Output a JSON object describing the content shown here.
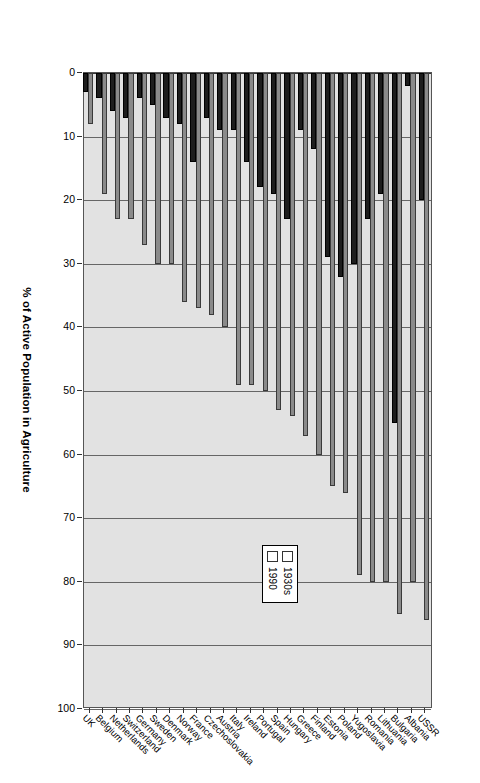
{
  "chart_data": {
    "type": "bar",
    "orientation": "vertical-bars-rotated",
    "title": "",
    "xlabel": "",
    "ylabel": "% of Active Population in Agriculture",
    "ylim": [
      0,
      100
    ],
    "ytick_step": 10,
    "yticks": [
      "0",
      "10",
      "20",
      "30",
      "40",
      "50",
      "60",
      "70",
      "80",
      "90",
      "100"
    ],
    "grid": true,
    "legend_position": "top-center",
    "categories": [
      "USSR",
      "Albania",
      "Bulgaria",
      "Lithuania",
      "Romania",
      "Yugoslavia",
      "Poland",
      "Estonia",
      "Finland",
      "Greece",
      "Hungary",
      "Spain",
      "Portugal",
      "Ireland",
      "Italy",
      "Austria",
      "Czechoslovakia",
      "France",
      "Norway",
      "Denmark",
      "Sweden",
      "Germany",
      "Switzerland",
      "Netherlands",
      "Belgium",
      "UK"
    ],
    "series": [
      {
        "name": "1930s",
        "color": "#8a8a8a",
        "values": [
          86,
          80,
          85,
          80,
          80,
          79,
          66,
          65,
          60,
          57,
          54,
          53,
          50,
          49,
          49,
          40,
          38,
          37,
          36,
          30,
          30,
          27,
          23,
          23,
          19,
          8
        ]
      },
      {
        "name": "1990",
        "color": "#1d1d1d",
        "values": [
          20,
          2,
          55,
          19,
          23,
          30,
          32,
          29,
          12,
          9,
          23,
          19,
          18,
          14,
          9,
          9,
          7,
          14,
          8,
          7,
          5,
          4,
          7,
          6,
          4,
          3
        ]
      }
    ]
  },
  "legend": {
    "items": [
      {
        "label": "1930s",
        "color": "#8a8a8a"
      },
      {
        "label": "1990",
        "color": "#1d1d1d"
      }
    ]
  },
  "axis": {
    "value_axis_title": "% of Active Population in Agriculture"
  }
}
